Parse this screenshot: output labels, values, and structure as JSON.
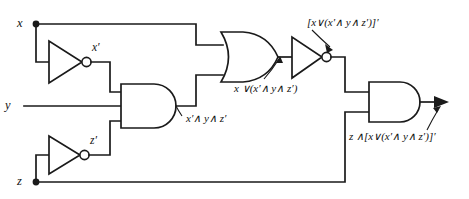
{
  "diagram": {
    "line_color": "#1a1a1a",
    "background_color": "#ffffff"
  },
  "inputs": [
    {
      "name": "input-x",
      "label": "x"
    },
    {
      "name": "input-y",
      "label": "y"
    },
    {
      "name": "input-z",
      "label": "z"
    }
  ],
  "signals": {
    "not_x": "x′",
    "not_z": "z′",
    "and3_out": "x′∧ y∧ z′",
    "or_out": "x ∨(x′∧ y∧ z′)",
    "not_or_out": "[x∨(x′∧ y∧ z′)]′",
    "final_out": "z ∧[x∨(x′∧ y∧ z′)]′"
  },
  "gates": [
    {
      "name": "inverter-x",
      "type": "NOT",
      "inputs": [
        "x"
      ],
      "output": "x′"
    },
    {
      "name": "inverter-z",
      "type": "NOT",
      "inputs": [
        "z"
      ],
      "output": "z′"
    },
    {
      "name": "and-gate-3input",
      "type": "AND",
      "inputs": [
        "x′",
        "y",
        "z′"
      ],
      "output": "x′∧ y∧ z′"
    },
    {
      "name": "or-gate",
      "type": "OR",
      "inputs": [
        "x",
        "x′∧ y∧ z′"
      ],
      "output": "x ∨(x′∧ y∧ z′)"
    },
    {
      "name": "inverter-or-output",
      "type": "NOT",
      "inputs": [
        "x ∨(x′∧ y∧ z′)"
      ],
      "output": "[x∨(x′∧ y∧ z′)]′"
    },
    {
      "name": "and-gate-final",
      "type": "AND",
      "inputs": [
        "[x∨(x′∧ y∧ z′)]′",
        "z"
      ],
      "output": "z ∧[x∨(x′∧ y∧ z′)]′"
    }
  ]
}
